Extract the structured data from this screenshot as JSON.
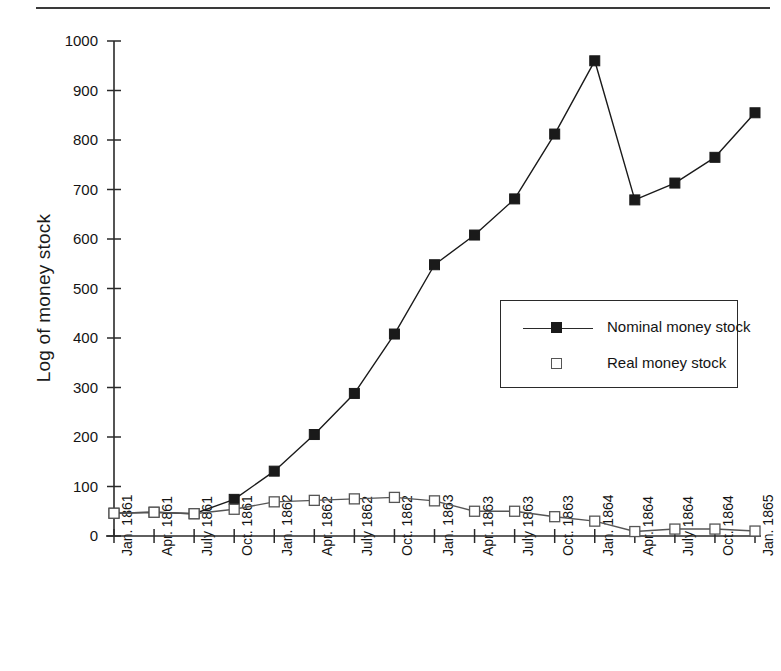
{
  "figure": {
    "has_top_rule": true,
    "background_color": "#ffffff",
    "ink_color": "#1a1a1a"
  },
  "chart_data": {
    "type": "line",
    "title": "",
    "xlabel": "",
    "ylabel": "Log of money stock",
    "ylim": [
      0,
      1000
    ],
    "ytick_values": [
      0,
      100,
      200,
      300,
      400,
      500,
      600,
      700,
      800,
      900,
      1000
    ],
    "ytick_labels": [
      "0",
      "100",
      "200",
      "300",
      "400",
      "500",
      "600",
      "700",
      "800",
      "900",
      "1000"
    ],
    "grid": false,
    "legend_position": "center-right-inside",
    "categories": [
      "Jan. 1861",
      "Apr. 1861",
      "July 1861",
      "Oct. 1861",
      "Jan. 1862",
      "Apr. 1862",
      "July 1862",
      "Oct. 1862",
      "Jan. 1863",
      "Apr. 1863",
      "July 1863",
      "Oct. 1863",
      "Jan. 1864",
      "Apr. 1864",
      "July 1864",
      "Oct. 1864",
      "Jan. 1865"
    ],
    "series": [
      {
        "name": "Nominal money stock",
        "marker": "filled-square",
        "color": "#1a1a1a",
        "values": [
          46,
          48,
          45,
          74,
          131,
          205,
          288,
          408,
          548,
          608,
          681,
          812,
          960,
          679,
          713,
          765,
          855
        ]
      },
      {
        "name": "Real money stock",
        "marker": "open-square",
        "color": "#555555",
        "values": [
          46,
          48,
          45,
          54,
          69,
          72,
          75,
          78,
          71,
          50,
          50,
          39,
          30,
          9,
          14,
          14,
          10
        ]
      }
    ]
  }
}
